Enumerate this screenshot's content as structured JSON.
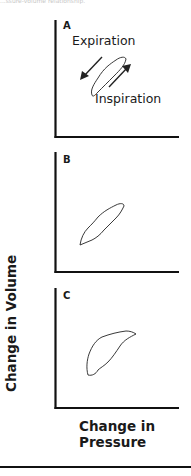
{
  "figure": {
    "top_caption_fragment": "...ssure-volume relationship.",
    "y_axis_label": "Change in Volume",
    "x_axis_label_line1": "Change in",
    "x_axis_label_line2": "Pressure",
    "panels": [
      {
        "label": "A",
        "annotations": {
          "expiration": "Expiration",
          "inspiration": "Inspiration"
        },
        "description": "Narrow pressure-volume loop with expiration arrow pointing down-left and inspiration arrow pointing up-right"
      },
      {
        "label": "B",
        "description": "Narrow elongated pressure-volume loop rising diagonally"
      },
      {
        "label": "C",
        "description": "Wider, curved pressure-volume loop bowed upward"
      }
    ]
  }
}
